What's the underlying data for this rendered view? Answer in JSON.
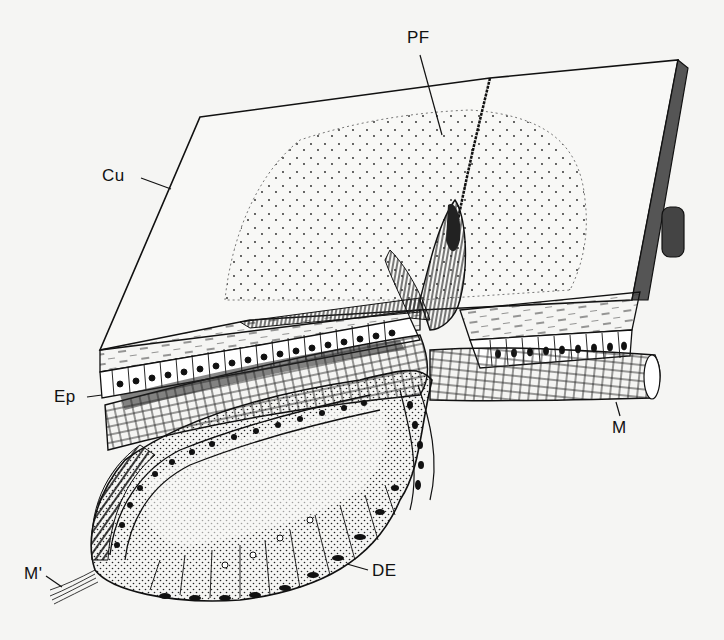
{
  "figure": {
    "labels": [
      {
        "id": "PF",
        "text": "PF",
        "x": 407,
        "y": 29
      },
      {
        "id": "Cu",
        "text": "Cu",
        "x": 102,
        "y": 167
      },
      {
        "id": "Ep",
        "text": "Ep",
        "x": 54,
        "y": 388
      },
      {
        "id": "M",
        "text": "M",
        "x": 612,
        "y": 419
      },
      {
        "id": "M_prime",
        "text": "M'",
        "x": 24,
        "y": 565
      },
      {
        "id": "DE",
        "text": "DE",
        "x": 372,
        "y": 562
      }
    ],
    "colors": {
      "ink": "#111111",
      "paper": "#f5f5f3"
    }
  }
}
